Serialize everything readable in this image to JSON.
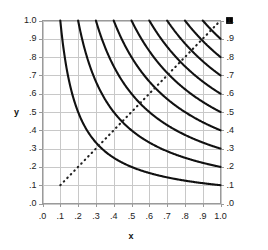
{
  "chart_data": {
    "type": "line",
    "title": "",
    "xlabel": "x",
    "ylabel": "y",
    "xlim": [
      0.0,
      1.0
    ],
    "ylim": [
      0.0,
      1.0
    ],
    "grid": true,
    "legend": "none",
    "x_ticks": [
      ".0",
      ".1",
      ".2",
      ".3",
      ".4",
      ".5",
      ".6",
      ".7",
      ".8",
      ".9",
      "1.0"
    ],
    "x_tick_values": [
      0.0,
      0.1,
      0.2,
      0.3,
      0.4,
      0.5,
      0.6,
      0.7,
      0.8,
      0.9,
      1.0
    ],
    "y_ticks_left": [
      "1.0",
      ".9",
      ".8",
      ".7",
      ".6",
      ".5",
      ".4",
      ".3",
      ".2",
      ".1",
      ".0"
    ],
    "y_ticks_right": [
      "1.",
      ".9",
      ".8",
      ".7",
      ".6",
      ".5",
      ".4",
      ".3",
      ".2",
      ".1",
      ".0"
    ],
    "y_tick_values": [
      1.0,
      0.9,
      0.8,
      0.7,
      0.6,
      0.5,
      0.4,
      0.3,
      0.2,
      0.1,
      0.0
    ],
    "series": [
      {
        "name": "xy = 0.1",
        "constant": 0.1,
        "style": "solid",
        "color": "#111111"
      },
      {
        "name": "xy = 0.2",
        "constant": 0.2,
        "style": "solid",
        "color": "#111111"
      },
      {
        "name": "xy = 0.3",
        "constant": 0.3,
        "style": "solid",
        "color": "#111111"
      },
      {
        "name": "xy = 0.4",
        "constant": 0.4,
        "style": "solid",
        "color": "#111111"
      },
      {
        "name": "xy = 0.5",
        "constant": 0.5,
        "style": "solid",
        "color": "#111111"
      },
      {
        "name": "xy = 0.6",
        "constant": 0.6,
        "style": "solid",
        "color": "#111111"
      },
      {
        "name": "xy = 0.7",
        "constant": 0.7,
        "style": "solid",
        "color": "#111111"
      },
      {
        "name": "xy = 0.8",
        "constant": 0.8,
        "style": "solid",
        "color": "#111111"
      },
      {
        "name": "xy = 0.9",
        "constant": 0.9,
        "style": "solid",
        "color": "#111111"
      }
    ],
    "diagonal": {
      "name": "y = x",
      "style": "dotted",
      "color": "#222222",
      "from": [
        0.1,
        0.1
      ],
      "to": [
        1.0,
        1.0
      ]
    },
    "marker": {
      "name": "corner-marker",
      "shape": "square",
      "color": "#000000",
      "x": 1.0,
      "y": 1.0
    }
  },
  "colors": {
    "curve": "#111111",
    "grid": "#c8c8c8",
    "axis": "#9a9a9a",
    "text": "#222222",
    "marker": "#000000",
    "background": "#ffffff"
  },
  "axes": {
    "x_title": "x",
    "y_title": "y"
  }
}
